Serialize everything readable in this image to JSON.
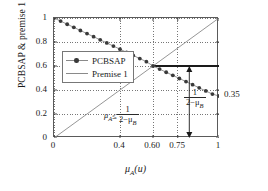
{
  "chart_data": {
    "type": "line",
    "title": "",
    "xlabel": "μₐ(u)",
    "ylabel": "PCBSAP & premise 1",
    "xlim": [
      0,
      1
    ],
    "ylim": [
      0,
      1
    ],
    "grid": true,
    "legend_position": "upper-left-inside",
    "xticks": [
      "0",
      "0.4",
      "0.60",
      "0.75",
      "1"
    ],
    "xtick_values": [
      0,
      0.4,
      0.6,
      0.75,
      1
    ],
    "yticks": [
      "0",
      "0.2",
      "0.4",
      "0.6",
      "0.8",
      "1"
    ],
    "ytick_values": [
      0,
      0.2,
      0.4,
      0.6,
      0.8,
      1
    ],
    "series": [
      {
        "name": "PCBSAP",
        "marker": "circle",
        "color": "#8a8a8a",
        "marker_color": "#3a3a3a",
        "x": [
          0.0,
          0.04,
          0.08,
          0.12,
          0.16,
          0.2,
          0.24,
          0.28,
          0.32,
          0.36,
          0.4,
          0.44,
          0.48,
          0.52,
          0.56,
          0.6,
          0.64,
          0.68,
          0.72,
          0.76,
          0.8,
          0.84,
          0.88,
          0.92,
          0.96,
          1.0
        ],
        "y": [
          1.0,
          0.974,
          0.948,
          0.922,
          0.896,
          0.87,
          0.844,
          0.818,
          0.792,
          0.766,
          0.74,
          0.714,
          0.688,
          0.662,
          0.636,
          0.6,
          0.574,
          0.548,
          0.522,
          0.496,
          0.47,
          0.444,
          0.418,
          0.392,
          0.366,
          0.35
        ]
      },
      {
        "name": "Premise 1",
        "marker": "none",
        "color": "#8a8a8a",
        "x": [
          0,
          1
        ],
        "y": [
          0,
          1
        ]
      }
    ],
    "annotations": [
      {
        "name": "right-value",
        "text": "0.35",
        "x": 1.0,
        "y": 0.35
      },
      {
        "name": "inequality",
        "lhs": "μ",
        "lhs_sub": "A",
        "relation": "≤",
        "numerator": "1",
        "denominator_prefix": "2−μ",
        "denominator_sub": "B"
      },
      {
        "name": "arrow-measure",
        "numerator": "1",
        "denominator_prefix": "2−μ",
        "denominator_sub": "B",
        "arrow_x": 0.82,
        "arrow_from_y": 0.0,
        "arrow_to_y": 0.6
      },
      {
        "name": "reference-line-horizontal",
        "y": 0.6,
        "from_x": 0.6,
        "to_x": 1.0
      }
    ]
  },
  "legend": {
    "entries": [
      {
        "label": "PCBSAP"
      },
      {
        "label": "Premise 1"
      }
    ]
  },
  "axes": {
    "y_title": "PCBSAP & premise 1",
    "x_title_base": "μ",
    "x_title_sub": "A",
    "x_title_tail": "(u)"
  }
}
